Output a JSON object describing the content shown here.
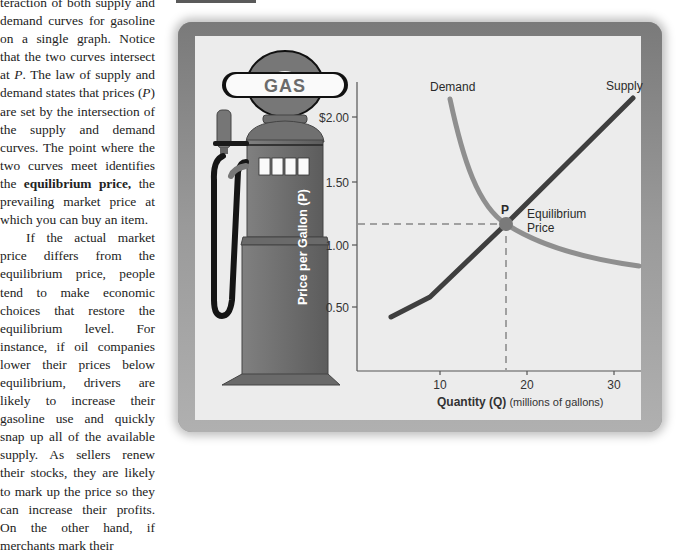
{
  "text_column": {
    "paragraph1": [
      {
        "t": "teraction of both supply and demand curves for gasoline on a single graph. Notice that the two curves intersect at "
      },
      {
        "t": "P",
        "style": "italic"
      },
      {
        "t": ". The law of supply and demand states that prices ("
      },
      {
        "t": "P",
        "style": "italic"
      },
      {
        "t": ") are set by the intersection of the supply and demand curves. The point where the two curves meet identifies the "
      },
      {
        "t": "equilibrium price,",
        "style": "bold"
      },
      {
        "t": " the prevailing market price at which you can buy an item."
      }
    ],
    "paragraph2": "If the actual market price differs from the equilibrium price, people tend to make economic choices that restore the equilibrium level. For instance, if oil companies lower their prices below equilibrium, drivers are likely to increase their gasoline use and quickly snap up all of the available supply. As sellers renew their stocks, they are likely to mark up the price so they can increase their profits. On the other hand, if merchants mark their"
  },
  "pump": {
    "sign_label": "GAS",
    "display_cells": 4
  },
  "colors": {
    "supply": "#3f3f3f",
    "demand": "#8f8f8f",
    "pump_body": "#6b6b6b",
    "panel": "#ececec",
    "axis": "#555555"
  },
  "chart_data": {
    "type": "line",
    "title": "",
    "xlabel": "Quantity (Q)",
    "xlabel_note": "(millions of gallons)",
    "ylabel": "Price per Gallon (P)",
    "x_ticks": [
      10,
      20,
      30
    ],
    "x_tick_labels": [
      "10",
      "20",
      "30"
    ],
    "y_ticks": [
      0.5,
      1.0,
      1.5,
      2.0
    ],
    "y_tick_labels": [
      "0.50",
      "1.00",
      "1.50",
      "$2.00"
    ],
    "xlim": [
      0,
      33
    ],
    "ylim": [
      0,
      2.3
    ],
    "grid": false,
    "series": [
      {
        "name": "Supply",
        "x": [
          4.3,
          9,
          17.6,
          32
        ],
        "y": [
          0.42,
          0.58,
          1.16,
          2.17
        ]
      },
      {
        "name": "Demand",
        "x": [
          11,
          13,
          15,
          17.6,
          22,
          27,
          33
        ],
        "y": [
          2.15,
          1.75,
          1.42,
          1.16,
          0.98,
          0.88,
          0.83
        ]
      }
    ],
    "annotations": [
      {
        "label": "P",
        "x": 17.6,
        "y": 1.16
      },
      {
        "label": "Equilibrium Price",
        "x": 19.5,
        "y": 1.16
      }
    ],
    "equilibrium": {
      "quantity": 17.6,
      "price": 1.16
    },
    "legend": {
      "supply_label": "Supply",
      "demand_label": "Demand",
      "position": "inline"
    }
  },
  "labels": {
    "point": "P",
    "eq_line1": "Equilibrium",
    "eq_line2": "Price",
    "supply": "Supply",
    "demand": "Demand",
    "x_axis_bold": "Quantity (Q)",
    "x_axis_note": " (millions of gallons)",
    "y_axis": "Price per Gallon (P)",
    "y_tick_2": "$2.00",
    "y_tick_150": "1.50",
    "y_tick_100": "1.00",
    "y_tick_050": "0.50",
    "x_tick_10": "10",
    "x_tick_20": "20",
    "x_tick_30": "30"
  }
}
